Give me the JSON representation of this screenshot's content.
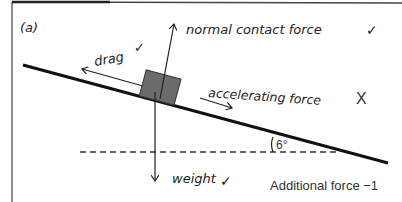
{
  "panel": {
    "label": "(a)"
  },
  "forces": {
    "normal": {
      "label": "normal contact force",
      "mark": "✓"
    },
    "drag": {
      "label": "drag",
      "mark": "✓"
    },
    "accelerating": {
      "label": "accelerating force",
      "mark": "X"
    },
    "weight": {
      "label": "weight",
      "mark": "✓"
    }
  },
  "angle": {
    "label": "6°"
  },
  "score_note": {
    "label": "Additional force −1"
  },
  "colors": {
    "block": "#6b6b6b",
    "line": "#222222",
    "mark_red": "#222222"
  }
}
